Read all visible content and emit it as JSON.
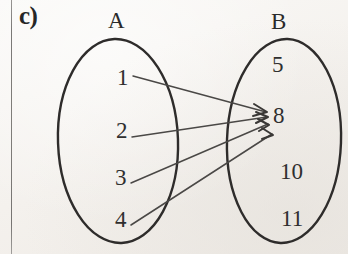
{
  "figure": {
    "part_label": "c)",
    "type": "mapping-diagram"
  },
  "sets": {
    "left": {
      "name": "A",
      "members": [
        "1",
        "2",
        "3",
        "4"
      ]
    },
    "right": {
      "name": "B",
      "members": [
        "5",
        "8",
        "10",
        "11"
      ]
    }
  },
  "mappings": [
    {
      "from": "1",
      "to": "8"
    },
    {
      "from": "2",
      "to": "8"
    },
    {
      "from": "3",
      "to": "8"
    },
    {
      "from": "4",
      "to": "8"
    }
  ],
  "colors": {
    "paper": "#f6f4f1",
    "ink": "#2e2c2b",
    "line": "#4a4846",
    "margin_rule": "#75736f"
  }
}
